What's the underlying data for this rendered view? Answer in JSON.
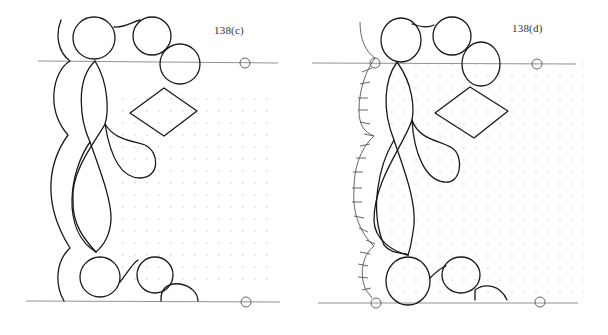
{
  "panels": [
    {
      "id": "c",
      "label": "138(c)",
      "features": [
        "top guideline with pin circle",
        "bottom guideline with pin circle",
        "outer scalloped border curve",
        "interlaced leaf motif",
        "three top circles",
        "three bottom circles",
        "diamond",
        "dotted ground"
      ]
    },
    {
      "id": "d",
      "label": "138(d)",
      "features": [
        "top guideline with pin circles",
        "bottom guideline with pin circles",
        "outer curved border with cross-hatch tick marks",
        "interlaced leaf motif",
        "three top circles",
        "bottom circles and partial arc",
        "diamond",
        "dotted ground"
      ]
    }
  ],
  "colors": {
    "ink": "#1a1a1a",
    "guide": "#777777",
    "dots": "#c8c8c8",
    "background": "#ffffff"
  }
}
